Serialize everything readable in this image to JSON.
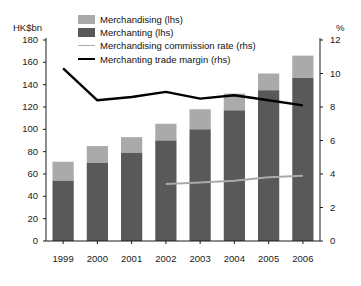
{
  "axes": {
    "left_unit": "HK$bn",
    "right_unit": "%",
    "left_ticks": [
      "180",
      "160",
      "140",
      "120",
      "100",
      "80",
      "60",
      "40",
      "20",
      "0"
    ],
    "right_ticks": [
      "12",
      "10",
      "8",
      "6",
      "4",
      "2",
      "0"
    ],
    "x_ticks": [
      "1999",
      "2000",
      "2001",
      "2002",
      "2003",
      "2004",
      "2005",
      "2006"
    ]
  },
  "legend": {
    "items": [
      {
        "label": "Merchandising (lhs)",
        "type": "swatch",
        "color": "#aaaaaa",
        "name": "legend-merchandising"
      },
      {
        "label": "Merchanting (lhs)",
        "type": "swatch",
        "color": "#595959",
        "name": "legend-merchanting"
      },
      {
        "label": "Merchandising commission rate (rhs)",
        "type": "line",
        "color": "#aaaaaa",
        "name": "legend-commission-rate"
      },
      {
        "label": "Merchanting trade margin (rhs)",
        "type": "line",
        "color": "#000000",
        "name": "legend-trade-margin"
      }
    ]
  },
  "colors": {
    "merchandising": "#aaaaaa",
    "merchanting": "#595959",
    "commission_rate_line": "#aaaaaa",
    "trade_margin_line": "#000000",
    "axis": "#1a1a1a"
  },
  "chart_data": {
    "type": "bar",
    "title": "",
    "subtitle": "",
    "xlabel": "",
    "ylabel": "HK$bn",
    "y2label": "%",
    "categories": [
      "1999",
      "2000",
      "2001",
      "2002",
      "2003",
      "2004",
      "2005",
      "2006"
    ],
    "ylim": [
      0,
      180
    ],
    "y2lim": [
      0,
      12
    ],
    "ytick_step": 20,
    "y2tick_step": 2,
    "grid": false,
    "legend_position": "top",
    "stacked": true,
    "series": [
      {
        "name": "Merchanting (lhs)",
        "axis": "left",
        "kind": "bar",
        "color": "#595959",
        "unit": "HK$bn",
        "values": [
          54,
          70,
          79,
          90,
          100,
          117,
          135,
          146
        ]
      },
      {
        "name": "Merchandising (lhs)",
        "axis": "left",
        "kind": "bar",
        "color": "#aaaaaa",
        "unit": "HK$bn",
        "values": [
          17,
          15,
          14,
          15,
          18,
          15,
          15,
          20
        ]
      },
      {
        "name": "Merchanting trade margin (rhs)",
        "axis": "right",
        "kind": "line",
        "color": "#000000",
        "unit": "%",
        "values": [
          10.3,
          8.4,
          8.6,
          8.9,
          8.5,
          8.7,
          8.4,
          8.1
        ]
      },
      {
        "name": "Merchandising commission rate (rhs)",
        "axis": "right",
        "kind": "line",
        "color": "#aaaaaa",
        "unit": "%",
        "x": [
          "2002",
          "2003",
          "2004",
          "2005",
          "2006"
        ],
        "values": [
          3.4,
          3.5,
          3.6,
          3.8,
          3.9
        ]
      }
    ],
    "stacked_totals": [
      71,
      85,
      93,
      105,
      118,
      132,
      150,
      166
    ]
  }
}
